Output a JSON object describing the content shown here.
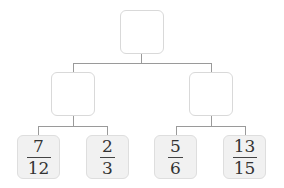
{
  "diagram": {
    "type": "tree",
    "root": {
      "label": ""
    },
    "middle": [
      {
        "label": ""
      },
      {
        "label": ""
      }
    ],
    "leaves": [
      {
        "numerator": "7",
        "denominator": "12"
      },
      {
        "numerator": "2",
        "denominator": "3"
      },
      {
        "numerator": "5",
        "denominator": "6"
      },
      {
        "numerator": "13",
        "denominator": "15"
      }
    ],
    "colors": {
      "empty_box_border": "#d9d9d9",
      "leaf_box_fill": "#f1f1f1",
      "connector": "#9a9a9a"
    }
  }
}
